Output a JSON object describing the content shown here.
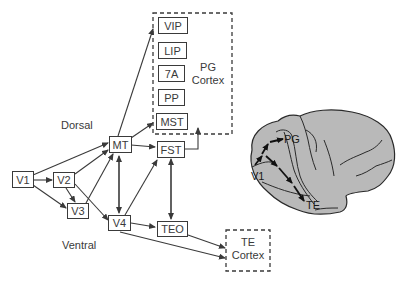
{
  "diagram": {
    "regions": {
      "pg_cortex": {
        "line1": "PG",
        "line2": "Cortex"
      },
      "te_cortex": {
        "line1": "TE",
        "line2": "Cortex"
      }
    },
    "pathways": {
      "dorsal": "Dorsal",
      "ventral": "Ventral"
    },
    "nodes": {
      "V1": "V1",
      "V2": "V2",
      "V3": "V3",
      "V4": "V4",
      "MT": "MT",
      "FST": "FST",
      "TEO": "TEO",
      "VIP": "VIP",
      "LIP": "LIP",
      "A7": "7A",
      "PP": "PP",
      "MST": "MST"
    },
    "brain": {
      "labels": {
        "PG": "PG",
        "V1": "V1",
        "TE": "TE"
      },
      "fill": "#b9b9b9"
    },
    "edges": [
      [
        "V1",
        "V2"
      ],
      [
        "V1",
        "V3"
      ],
      [
        "V1",
        "MT"
      ],
      [
        "V2",
        "V3"
      ],
      [
        "V2",
        "MT"
      ],
      [
        "V2",
        "V4"
      ],
      [
        "V3",
        "MT"
      ],
      [
        "MT",
        "V4"
      ],
      [
        "V4",
        "MT"
      ],
      [
        "MT",
        "PG Cortex (VIP)"
      ],
      [
        "MT",
        "MST"
      ],
      [
        "MT",
        "FST"
      ],
      [
        "V4",
        "FST"
      ],
      [
        "V4",
        "TEO"
      ],
      [
        "V4",
        "TE Cortex"
      ],
      [
        "FST",
        "TEO"
      ],
      [
        "TEO",
        "FST"
      ],
      [
        "TEO",
        "TE Cortex"
      ],
      [
        "FST",
        "PG Cortex"
      ]
    ]
  }
}
